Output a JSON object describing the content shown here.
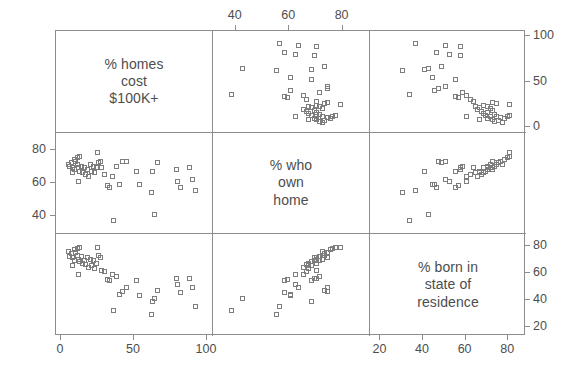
{
  "figure": {
    "type": "scatterplot-matrix",
    "n_variables": 3,
    "marker_shape": "open-square",
    "marker_color": "#7d7d7d",
    "frame_color": "#8c8c8c",
    "text_color": "#4d4d4d",
    "background": "#ffffff"
  },
  "variables": [
    {
      "key": "cost100k",
      "label": "% homes\ncost\n$100K+",
      "label_lines": [
        "% homes",
        "cost",
        "$100K+"
      ],
      "min": 0,
      "max": 100
    },
    {
      "key": "ownhome",
      "label": "% who\nown\nhome",
      "label_lines": [
        "% who",
        "own",
        "home"
      ],
      "min": 33,
      "max": 88
    },
    {
      "key": "bornstate",
      "label": "% born in\nstate of\nresidence",
      "label_lines": [
        "% born in",
        "state of",
        "residence"
      ],
      "min": 17,
      "max": 86
    }
  ],
  "axes": {
    "top": {
      "variable": "ownhome",
      "ticks": [
        40,
        60,
        80
      ],
      "labels": [
        "40",
        "60",
        "80"
      ]
    },
    "bottom_left": {
      "variable": "cost100k",
      "ticks": [
        0,
        50,
        100
      ],
      "labels": [
        "0",
        "50",
        "100"
      ]
    },
    "bottom_right": {
      "variable": "bornstate",
      "ticks": [
        20,
        40,
        60,
        80
      ],
      "labels": [
        "20",
        "40",
        "60",
        "80"
      ]
    },
    "left_middle": {
      "variable": "ownhome",
      "ticks": [
        40,
        60,
        80
      ],
      "labels": [
        "40",
        "60",
        "80"
      ]
    },
    "right_top": {
      "variable": "cost100k",
      "ticks": [
        0,
        50,
        100
      ],
      "labels": [
        "0",
        "50",
        "100"
      ]
    },
    "right_bottom": {
      "variable": "bornstate",
      "ticks": [
        20,
        40,
        60,
        80
      ],
      "labels": [
        "20",
        "40",
        "60",
        "80"
      ]
    }
  },
  "chart_data": {
    "type": "scatter",
    "title": "",
    "xlabel": "",
    "ylabel": "",
    "grid": false,
    "legend": "none",
    "layout": "3x3 scatterplot matrix, diagonal holds variable name labels",
    "variables": [
      "% homes cost $100K+",
      "% who own home",
      "% born in state of residence"
    ],
    "axis_ranges": {
      "% homes cost $100K+": [
        0,
        100
      ],
      "% who own home": [
        33,
        88
      ],
      "% born in state of residence": [
        17,
        86
      ]
    },
    "points": [
      {
        "cost100k": 8,
        "ownhome": 70,
        "bornstate": 72
      },
      {
        "cost100k": 6,
        "ownhome": 71,
        "bornstate": 73
      },
      {
        "cost100k": 7,
        "ownhome": 73,
        "bornstate": 75
      },
      {
        "cost100k": 9,
        "ownhome": 69,
        "bornstate": 70
      },
      {
        "cost100k": 11,
        "ownhome": 72,
        "bornstate": 74
      },
      {
        "cost100k": 12,
        "ownhome": 70,
        "bornstate": 71
      },
      {
        "cost100k": 10,
        "ownhome": 74,
        "bornstate": 76
      },
      {
        "cost100k": 13,
        "ownhome": 68,
        "bornstate": 69
      },
      {
        "cost100k": 14,
        "ownhome": 71,
        "bornstate": 73
      },
      {
        "cost100k": 5,
        "ownhome": 72,
        "bornstate": 77
      },
      {
        "cost100k": 16,
        "ownhome": 70,
        "bornstate": 70
      },
      {
        "cost100k": 15,
        "ownhome": 67,
        "bornstate": 68
      },
      {
        "cost100k": 18,
        "ownhome": 69,
        "bornstate": 72
      },
      {
        "cost100k": 9,
        "ownhome": 75,
        "bornstate": 78
      },
      {
        "cost100k": 11,
        "ownhome": 76,
        "bornstate": 79
      },
      {
        "cost100k": 8,
        "ownhome": 67,
        "bornstate": 66
      },
      {
        "cost100k": 20,
        "ownhome": 72,
        "bornstate": 71
      },
      {
        "cost100k": 17,
        "ownhome": 66,
        "bornstate": 67
      },
      {
        "cost100k": 19,
        "ownhome": 65,
        "bornstate": 65
      },
      {
        "cost100k": 22,
        "ownhome": 71,
        "bornstate": 70
      },
      {
        "cost100k": 13,
        "ownhome": 77,
        "bornstate": 80
      },
      {
        "cost100k": 24,
        "ownhome": 70,
        "bornstate": 68
      },
      {
        "cost100k": 21,
        "ownhome": 68,
        "bornstate": 66
      },
      {
        "cost100k": 26,
        "ownhome": 73,
        "bornstate": 74
      },
      {
        "cost100k": 23,
        "ownhome": 67,
        "bornstate": 64
      },
      {
        "cost100k": 28,
        "ownhome": 70,
        "bornstate": 63
      },
      {
        "cost100k": 30,
        "ownhome": 66,
        "bornstate": 62
      },
      {
        "cost100k": 32,
        "ownhome": 59,
        "bornstate": 56
      },
      {
        "cost100k": 33,
        "ownhome": 58,
        "bornstate": 55
      },
      {
        "cost100k": 35,
        "ownhome": 65,
        "bornstate": 60
      },
      {
        "cost100k": 27,
        "ownhome": 74,
        "bornstate": 72
      },
      {
        "cost100k": 38,
        "ownhome": 71,
        "bornstate": 58
      },
      {
        "cost100k": 42,
        "ownhome": 74,
        "bornstate": 47
      },
      {
        "cost100k": 45,
        "ownhome": 74,
        "bornstate": 50
      },
      {
        "cost100k": 40,
        "ownhome": 60,
        "bornstate": 45
      },
      {
        "cost100k": 54,
        "ownhome": 60,
        "bornstate": 44
      },
      {
        "cost100k": 52,
        "ownhome": 68,
        "bornstate": 55
      },
      {
        "cost100k": 64,
        "ownhome": 42,
        "bornstate": 42
      },
      {
        "cost100k": 66,
        "ownhome": 73,
        "bornstate": 48
      },
      {
        "cost100k": 63,
        "ownhome": 68,
        "bornstate": 40
      },
      {
        "cost100k": 79,
        "ownhome": 69,
        "bornstate": 57
      },
      {
        "cost100k": 80,
        "ownhome": 62,
        "bornstate": 52
      },
      {
        "cost100k": 82,
        "ownhome": 58,
        "bornstate": 46
      },
      {
        "cost100k": 88,
        "ownhome": 70,
        "bornstate": 57
      },
      {
        "cost100k": 90,
        "ownhome": 63,
        "bornstate": 50
      },
      {
        "cost100k": 92,
        "ownhome": 56,
        "bornstate": 36
      },
      {
        "cost100k": 36,
        "ownhome": 38,
        "bornstate": 33
      },
      {
        "cost100k": 25,
        "ownhome": 79,
        "bornstate": 80
      },
      {
        "cost100k": 62,
        "ownhome": 55,
        "bornstate": 30
      },
      {
        "cost100k": 12,
        "ownhome": 62,
        "bornstate": 60
      }
    ]
  }
}
